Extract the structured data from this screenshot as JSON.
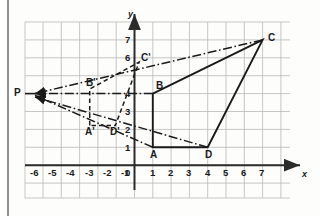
{
  "figure": {
    "kind": "coordinate-grid-diagram",
    "colors": {
      "grid": "#b9b9b9",
      "axis": "#2b2b2b",
      "ink": "#1a1a1a",
      "paper": "#fdfdfc",
      "binding": "#8f8f8f"
    }
  },
  "axes": {
    "x_label": "x",
    "y_label": "y",
    "x_ticks": [
      "-6",
      "-5",
      "-4",
      "-3",
      "-2",
      "-1",
      "0",
      "1",
      "2",
      "3",
      "4",
      "5",
      "6",
      "7"
    ],
    "y_ticks": [
      "7",
      "6",
      "4",
      "3",
      "2",
      "1"
    ],
    "x_range": [
      -7,
      8
    ],
    "y_range": [
      -2,
      8
    ],
    "origin_label": "0"
  },
  "points": {
    "A": {
      "label": "A",
      "x": 1,
      "y": 1
    },
    "B": {
      "label": "B",
      "x": 1,
      "y": 4
    },
    "C": {
      "label": "C",
      "x": 7,
      "y": 7
    },
    "D": {
      "label": "D",
      "x": 4,
      "y": 1
    },
    "Ap": {
      "label": "A'",
      "x": -2.45,
      "y": 2.2
    },
    "Bp": {
      "label": "B'",
      "x": -2.45,
      "y": 4.25
    },
    "Cp": {
      "label": "C'",
      "x": 0.25,
      "y": 5.75
    },
    "Dp": {
      "label": "D'",
      "x": -1.05,
      "y": 2.2
    },
    "P": {
      "label": "P",
      "x": -6,
      "y": 4
    }
  },
  "shapes": {
    "original_outline": "A-B-C-D-A",
    "image_outline": "A'-B'-C'-D'-A'",
    "projection_rays": [
      "C to P",
      "B to P",
      "A to P",
      "D to P"
    ]
  }
}
